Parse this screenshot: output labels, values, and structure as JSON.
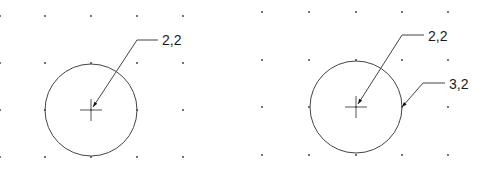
{
  "colors": {
    "background": "#ffffff",
    "stroke": "#444444",
    "text": "#1a1a1a",
    "grid_dot": "#333333"
  },
  "panels": [
    {
      "name": "left-drawing",
      "grid": {
        "xs": [
          45,
          91,
          137,
          183
        ],
        "ys": [
          16,
          63,
          110,
          157
        ],
        "extra_left_x": 0
      },
      "circle": {
        "cx": 91,
        "cy": 110,
        "r": 46
      },
      "center_mark": {
        "x": 91,
        "y": 110,
        "size": 11
      },
      "leaders": [
        {
          "label": "2,2",
          "tip": [
            93,
            107
          ],
          "elbow": [
            137,
            40
          ],
          "end": [
            158,
            40
          ],
          "text_pos": [
            162,
            45
          ]
        }
      ]
    },
    {
      "name": "right-drawing",
      "grid": {
        "xs": [
          262,
          309,
          356,
          402,
          448
        ],
        "ys": [
          12,
          60,
          107,
          155
        ]
      },
      "circle": {
        "cx": 356,
        "cy": 107,
        "r": 46
      },
      "center_mark": {
        "x": 356,
        "y": 107,
        "size": 11
      },
      "leaders": [
        {
          "label": "2,2",
          "tip": [
            358,
            104
          ],
          "elbow": [
            402,
            35
          ],
          "end": [
            424,
            35
          ],
          "text_pos": [
            428,
            41
          ]
        },
        {
          "label": "3,2",
          "tip": [
            402,
            107
          ],
          "elbow": [
            423,
            83
          ],
          "end": [
            445,
            83
          ],
          "text_pos": [
            449,
            89
          ]
        }
      ]
    }
  ],
  "labels": {
    "left_leader_1": "2,2",
    "right_leader_1": "2,2",
    "right_leader_2": "3,2"
  }
}
